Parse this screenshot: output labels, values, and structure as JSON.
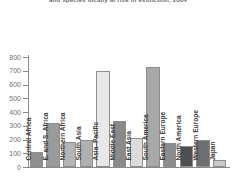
{
  "chart_data": {
    "type": "bar",
    "title": "and species locally at risk of extinction, 2004",
    "xlabel": "",
    "ylabel": "",
    "ylim": [
      0,
      800
    ],
    "yticks": [
      0,
      100,
      200,
      300,
      400,
      500,
      600,
      700,
      800
    ],
    "ytick_labels": [
      "0",
      "100",
      "200",
      "300",
      "400",
      "500",
      "600",
      "700",
      "800"
    ],
    "grid": false,
    "legend": "none",
    "categories": [
      "Central Africa",
      "E. and S. Africa",
      "Northern Africa",
      "South Asia",
      "Asia–Pacific",
      "Middle East",
      "East Asia",
      "South America",
      "Eastern Europe",
      "North America",
      "Western Europe",
      "Japan"
    ],
    "values": [
      108,
      318,
      180,
      196,
      700,
      333,
      208,
      725,
      178,
      152,
      195,
      48
    ],
    "bar_colors": [
      "#8f8f8f",
      "#9a9a9a",
      "#b5b5b5",
      "#b0b0b0",
      "#e8e8e8",
      "#8a8a8a",
      "#dcdcdc",
      "#a8a8a8",
      "#8c8c8c",
      "#4f4f4f",
      "#6e6e6e",
      "#c9c9c9"
    ]
  }
}
